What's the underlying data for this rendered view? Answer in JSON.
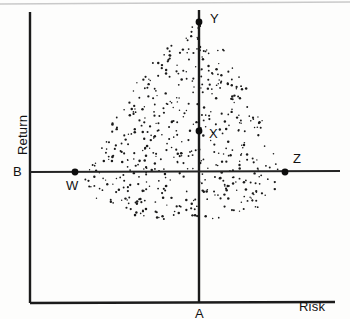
{
  "figure": {
    "axes": {
      "x_label": "Risk",
      "y_label": "Return"
    },
    "colors": {
      "axis": "#1b1b1b",
      "dot": "#1a1a1a",
      "marker": "#0d0d0d",
      "background": "#fdfdfc"
    },
    "labels": {
      "a": "A",
      "b": "B",
      "w": "W",
      "x": "X",
      "y": "Y",
      "z": "Z"
    }
  },
  "chart_data": {
    "type": "scatter",
    "title": "",
    "xlabel": "Risk",
    "ylabel": "Return",
    "grid": false,
    "legend": null,
    "axis_origin_px": {
      "x": 199,
      "y": 172
    },
    "axis_ranges_px": {
      "x_axis_line_y": 303,
      "x_axis_from": 30,
      "x_axis_to": 335,
      "y_axis_line_x": 199,
      "y_axis_from": 10,
      "y_axis_to": 303,
      "left_frame_x": 30,
      "b_line_y": 172,
      "b_line_from": 30,
      "b_line_to": 340
    },
    "annotations": [
      {
        "label": "Y",
        "px": [
          199,
          22
        ],
        "marker": true,
        "label_offset": [
          11,
          -10
        ],
        "note": "maximum return point on vertical reference line"
      },
      {
        "label": "X",
        "px": [
          199,
          131
        ],
        "marker": true,
        "label_offset": [
          10,
          -4
        ],
        "note": "interior point on vertical reference line"
      },
      {
        "label": "W",
        "px": [
          75,
          172
        ],
        "marker": true,
        "label_offset": [
          -9,
          7
        ],
        "note": "left intersection of horizontal reference line with feasible set"
      },
      {
        "label": "Z",
        "px": [
          285,
          172
        ],
        "marker": true,
        "label_offset": [
          8,
          -20
        ],
        "note": "right intersection of horizontal reference line with feasible set"
      },
      {
        "label": "A",
        "px": [
          199,
          303
        ],
        "marker": false,
        "label_offset": [
          -4,
          4
        ],
        "note": "foot of vertical reference line on Risk axis"
      },
      {
        "label": "B",
        "px": [
          30,
          172
        ],
        "marker": false,
        "label_offset": [
          -17,
          -7
        ],
        "note": "foot of horizontal reference line on Return axis"
      }
    ],
    "cloud": {
      "description": "dense scatter of small dots forming a rounded-triangular feasible region",
      "n_points": 520,
      "apex_px": [
        199,
        25
      ],
      "left_extent_px": 62,
      "right_extent_px": 296,
      "bottom_px": 222,
      "seed": 20240117
    }
  }
}
